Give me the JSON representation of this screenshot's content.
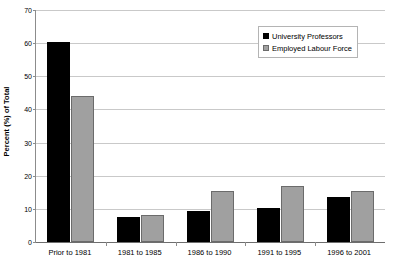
{
  "chart_data": {
    "type": "bar",
    "title": "",
    "xlabel": "",
    "ylabel": "Percent (%) of Total",
    "categories": [
      "Prior to 1981",
      "1981 to 1985",
      "1986 to 1990",
      "1991 to 1995",
      "1996 to 2001"
    ],
    "series": [
      {
        "name": "University Professors",
        "color": "#000000",
        "values": [
          60.2,
          7.4,
          9.5,
          10.3,
          13.5
        ]
      },
      {
        "name": "Employed Labour Force",
        "color": "#a0a0a0",
        "values": [
          44.2,
          8.3,
          15.3,
          16.8,
          15.5
        ]
      }
    ],
    "ylim": [
      0,
      70
    ],
    "yticks": [
      0,
      10,
      20,
      30,
      40,
      50,
      60,
      70
    ],
    "ytick_labels": [
      "0",
      "10",
      "20",
      "30",
      "40",
      "50",
      "60",
      "70"
    ],
    "grid": true,
    "legend_position": "top-right"
  },
  "legend": {
    "items": [
      {
        "label": "University Professors"
      },
      {
        "label": "Employed Labour Force"
      }
    ]
  }
}
